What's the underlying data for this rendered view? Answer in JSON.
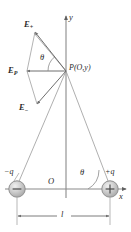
{
  "figure": {
    "type": "physics-vector-diagram",
    "colors": {
      "line": "#6e6e6e",
      "axis": "#7a7a7a",
      "text": "#2b2b2b",
      "charge_fill": "#c9c9c9",
      "charge_stroke": "#8a8a8a"
    },
    "labels": {
      "e_plus": "E",
      "e_plus_sub": "+",
      "e_resultant": "E",
      "e_resultant_sub": "P",
      "e_minus": "E",
      "e_minus_sub": "−",
      "point_p": "P(O,y)",
      "axis_y": "y",
      "axis_x": "x",
      "origin": "O",
      "charge_negative": "−q",
      "charge_positive": "+q",
      "theta_upper": "θ",
      "theta_lower": "θ",
      "separation": "l",
      "charge_symbol_negative": "−",
      "charge_symbol_positive": "+"
    },
    "geometry": {
      "point_p": {
        "x": 66,
        "y": 71
      },
      "origin": {
        "x": 66,
        "y": 189
      },
      "charge_negative": {
        "x": 17,
        "y": 189
      },
      "charge_positive": {
        "x": 110,
        "y": 189
      },
      "e_plus_tip": {
        "x": 34,
        "y": 31
      },
      "e_minus_tip": {
        "x": 36,
        "y": 105
      },
      "e_resultant_tip": {
        "x": 26,
        "y": 71
      },
      "separation_label": {
        "x": 62,
        "y": 216
      }
    }
  }
}
